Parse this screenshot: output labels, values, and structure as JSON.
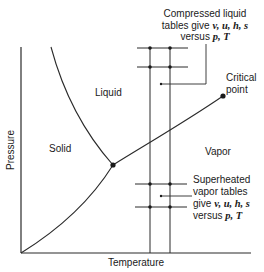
{
  "diagram": {
    "title": "",
    "axes": {
      "x_label": "Temperature",
      "y_label": "Pressure"
    },
    "regions": {
      "solid": "Solid",
      "liquid": "Liquid",
      "vapor": "Vapor"
    },
    "points": {
      "critical_line1": "Critical",
      "critical_line2": "point"
    },
    "annotations": {
      "compressed": {
        "line1": "Compressed liquid",
        "line2_prefix": "tables give ",
        "line2_vars": "v, u, h, s",
        "line3_prefix": "versus ",
        "line3_vars": "p, T"
      },
      "superheated": {
        "line1": "Superheated",
        "line2": "vapor tables",
        "line3_prefix": "give ",
        "line3_vars": "v, u, h, s",
        "line4_prefix": "versus ",
        "line4_vars": "p, T"
      }
    },
    "colors": {
      "line": "#2a2a2a",
      "text": "#1a1a1a",
      "background": "#ffffff"
    }
  }
}
